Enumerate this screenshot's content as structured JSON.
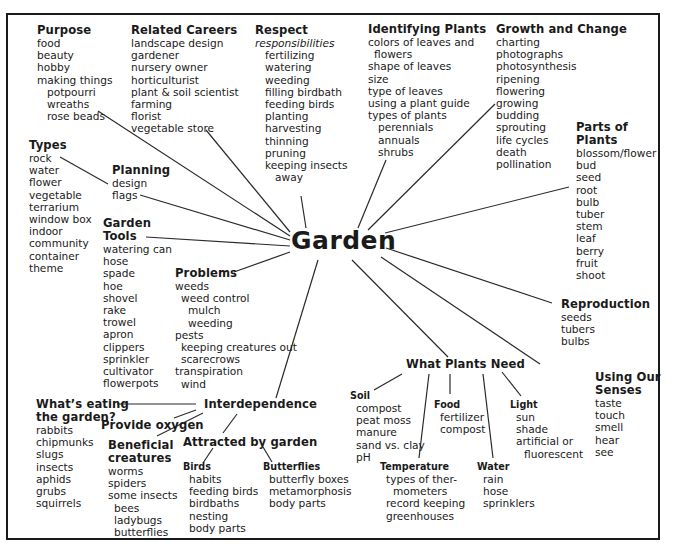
{
  "center": "Garden",
  "purpose": {
    "heading": "Purpose",
    "items": [
      "food",
      "beauty",
      "hobby",
      "making things"
    ],
    "sub": [
      "potpourri",
      "wreaths",
      "rose beads"
    ]
  },
  "careers": {
    "heading": "Related Careers",
    "items": [
      "landscape design",
      "gardener",
      "nursery owner",
      "horticulturist",
      "plant & soil scientist",
      "farming",
      "florist",
      "vegetable store"
    ]
  },
  "respect": {
    "heading": "Respect",
    "subheading": "responsibilities",
    "items": [
      "fertilizing",
      "watering",
      "weeding",
      "filling birdbath",
      "feeding birds",
      "planting",
      "harvesting",
      "thinning",
      "pruning",
      "keeping insects",
      "away"
    ]
  },
  "identifying": {
    "heading": "Identifying Plants",
    "items": [
      "colors of leaves and",
      "flowers",
      "shape of leaves",
      "size",
      "type of leaves",
      "using a plant guide",
      "types of plants"
    ],
    "sub": [
      "perennials",
      "annuals",
      "shrubs"
    ]
  },
  "growth": {
    "heading": "Growth and Change",
    "items": [
      "charting",
      "photographs",
      "photosynthesis",
      "ripening",
      "flowering",
      "growing",
      "budding",
      "sprouting",
      "life cycles",
      "death",
      "pollination"
    ]
  },
  "parts": {
    "heading_line1": "Parts of",
    "heading_line2": "Plants",
    "items": [
      "blossom/flower",
      "bud",
      "seed",
      "root",
      "bulb",
      "tuber",
      "stem",
      "leaf",
      "berry",
      "fruit",
      "shoot"
    ]
  },
  "types": {
    "heading": "Types",
    "items": [
      "rock",
      "water",
      "flower",
      "vegetable",
      "terrarium",
      "window box",
      "indoor",
      "community",
      "container",
      "theme"
    ]
  },
  "planning": {
    "heading": "Planning",
    "items": [
      "design",
      "flags"
    ]
  },
  "tools": {
    "heading_line1": "Garden",
    "heading_line2": "Tools",
    "items": [
      "watering can",
      "hose",
      "spade",
      "hoe",
      "shovel",
      "rake",
      "trowel",
      "apron",
      "clippers",
      "sprinkler",
      "cultivator",
      "flowerpots"
    ]
  },
  "problems": {
    "heading": "Problems",
    "items": [
      "weeds",
      "weed control",
      "mulch",
      "weeding",
      "pests",
      "keeping creatures out",
      "scarecrows",
      "transpiration",
      "wind"
    ]
  },
  "reproduction": {
    "heading": "Reproduction",
    "items": [
      "seeds",
      "tubers",
      "bulbs"
    ]
  },
  "senses": {
    "heading_line1": "Using Our",
    "heading_line2": "Senses",
    "items": [
      "taste",
      "touch",
      "smell",
      "hear",
      "see"
    ]
  },
  "needs": {
    "heading": "What Plants Need",
    "soil": {
      "heading": "Soil",
      "items": [
        "compost",
        "peat moss",
        "manure",
        "sand vs. clay",
        "pH"
      ]
    },
    "food": {
      "heading": "Food",
      "items": [
        "fertilizer",
        "compost"
      ]
    },
    "light": {
      "heading": "Light",
      "items": [
        "sun",
        "shade",
        "artificial or",
        "fluorescent"
      ]
    },
    "temperature": {
      "heading": "Temperature",
      "items": [
        "types of ther-",
        "mometers",
        "record keeping",
        "greenhouses"
      ]
    },
    "water": {
      "heading": "Water",
      "items": [
        "rain",
        "hose",
        "sprinklers"
      ]
    }
  },
  "interdependence": {
    "heading": "Interdependence",
    "eating": {
      "heading_line1": "What’s eating",
      "heading_line2": "the garden?",
      "items": [
        "rabbits",
        "chipmunks",
        "slugs",
        "insects",
        "aphids",
        "grubs",
        "squirrels"
      ]
    },
    "oxygen": {
      "heading": "Provide oxygen"
    },
    "beneficial": {
      "heading_line1": "Beneficial",
      "heading_line2": "creatures",
      "items": [
        "worms",
        "spiders",
        "some insects"
      ],
      "sub": [
        "bees",
        "ladybugs",
        "butterflies"
      ]
    },
    "attracted": {
      "heading": "Attracted by garden",
      "birds": {
        "heading": "Birds",
        "items": [
          "habits",
          "feeding birds",
          "birdbaths",
          "nesting",
          "body parts"
        ]
      },
      "butterflies": {
        "heading": "Butterflies",
        "items": [
          "butterfly boxes",
          "metamorphosis",
          "body parts"
        ]
      }
    }
  }
}
